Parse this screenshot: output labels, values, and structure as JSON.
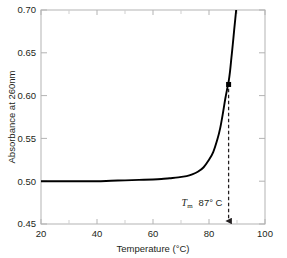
{
  "chart_data": {
    "type": "line",
    "title": "",
    "subtitle": "",
    "xlabel": "Temperature (°C)",
    "ylabel": "Absorbance at 260nm",
    "xlim": [
      20,
      100
    ],
    "ylim": [
      0.45,
      0.7
    ],
    "grid": false,
    "legend": null,
    "x_ticks": [
      20,
      40,
      60,
      80,
      100
    ],
    "x_tick_labels": [
      "20",
      "40",
      "60",
      "80",
      "100"
    ],
    "x_minor_ticks": [
      30,
      50,
      70,
      90
    ],
    "y_ticks": [
      0.45,
      0.5,
      0.55,
      0.6,
      0.65,
      0.7
    ],
    "y_tick_labels": [
      "0.45",
      "0.50",
      "0.55",
      "0.60",
      "0.65",
      "0.70"
    ],
    "series": [
      {
        "name": "DNA melting curve",
        "color": "#000000",
        "x": [
          20,
          25,
          30,
          35,
          40,
          45,
          50,
          55,
          60,
          63,
          66,
          69,
          72,
          74,
          76,
          78,
          80,
          81.5,
          83,
          84,
          85,
          85.8,
          86.5,
          87,
          87.5,
          88,
          88.5,
          89,
          89.4,
          89.8
        ],
        "y": [
          0.5,
          0.5,
          0.5,
          0.5,
          0.5,
          0.5005,
          0.501,
          0.5015,
          0.502,
          0.5025,
          0.5035,
          0.5045,
          0.506,
          0.508,
          0.511,
          0.516,
          0.525,
          0.534,
          0.549,
          0.562,
          0.58,
          0.596,
          0.608,
          0.616,
          0.628,
          0.644,
          0.66,
          0.677,
          0.69,
          0.703
        ]
      }
    ],
    "markers": [
      {
        "name": "tm-point",
        "x": 87,
        "y": 0.613,
        "shape": "square",
        "color": "#000000"
      }
    ],
    "annotations": [
      {
        "name": "tm-annotation",
        "symbol": "T",
        "subscript": "m",
        "value": "87° C",
        "x": 87,
        "text_y": 0.471,
        "arrow_from_y": 0.608,
        "arrow_to_y": 0.45,
        "style": "dashed-arrow"
      }
    ]
  },
  "colors": {
    "axis": "#b3b3b3",
    "curve": "#000000",
    "text": "#231f20",
    "background": "#ffffff",
    "annotation": "#231f20"
  }
}
